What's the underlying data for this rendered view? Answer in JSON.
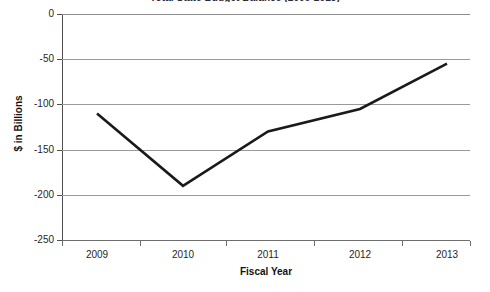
{
  "chart_data": {
    "type": "line",
    "title": "Total State Budget Balance (2009-2013)",
    "xlabel": "Fiscal Year",
    "ylabel": "$ in Billions",
    "categories": [
      "2009",
      "2010",
      "2011",
      "2012",
      "2013"
    ],
    "series": [
      {
        "name": "Total State Budget Balance",
        "values": [
          -110,
          -190,
          -130,
          -105,
          -55
        ]
      }
    ],
    "ylim": [
      -250,
      0
    ],
    "yticks": [
      0,
      -50,
      -100,
      -150,
      -200,
      -250
    ],
    "ytick_labels": [
      "0",
      "-50",
      "-100",
      "-150",
      "-200",
      "-250"
    ],
    "grid": true,
    "legend": "none",
    "line_color": "#1a1a1a"
  },
  "axis": {
    "y_title": "$ in Billions",
    "x_title": "Fiscal Year"
  },
  "ticks": {
    "y": [
      {
        "label": "0",
        "value": 0
      },
      {
        "label": "-50",
        "value": -50
      },
      {
        "label": "-100",
        "value": -100
      },
      {
        "label": "-150",
        "value": -150
      },
      {
        "label": "-200",
        "value": -200
      },
      {
        "label": "-250",
        "value": -250
      }
    ],
    "x": [
      {
        "label": "2009",
        "value": -110
      },
      {
        "label": "2010",
        "value": -190
      },
      {
        "label": "2011",
        "value": -130
      },
      {
        "label": "2012",
        "value": -105
      },
      {
        "label": "2013",
        "value": -55
      }
    ]
  }
}
